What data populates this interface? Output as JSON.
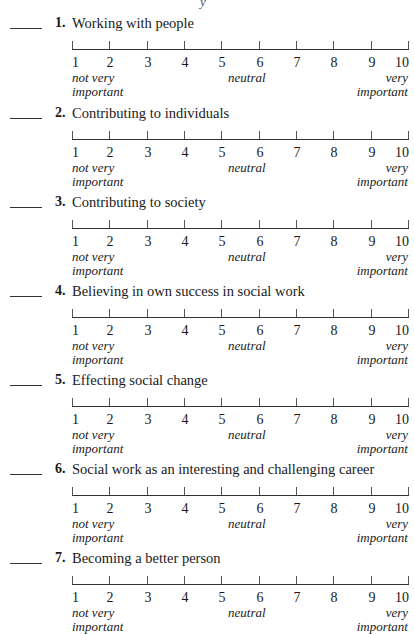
{
  "page": {
    "top_fragment": "y"
  },
  "scale": {
    "points": [
      "1",
      "2",
      "3",
      "4",
      "5",
      "6",
      "7",
      "8",
      "9",
      "10"
    ],
    "low_label_line1": "not very",
    "low_label_line2": "important",
    "mid_label": "neutral",
    "high_label_line1": "very",
    "high_label_line2": "important"
  },
  "items": [
    {
      "number": "1.",
      "text": "Working with people",
      "answer": ""
    },
    {
      "number": "2.",
      "text": "Contributing to individuals",
      "answer": ""
    },
    {
      "number": "3.",
      "text": "Contributing to society",
      "answer": ""
    },
    {
      "number": "4.",
      "text": "Believing in own success in social work",
      "answer": ""
    },
    {
      "number": "5.",
      "text": "Effecting social change",
      "answer": ""
    },
    {
      "number": "6.",
      "text": "Social work as an interesting and challenging career",
      "answer": ""
    },
    {
      "number": "7.",
      "text": "Becoming a better person",
      "answer": ""
    }
  ]
}
